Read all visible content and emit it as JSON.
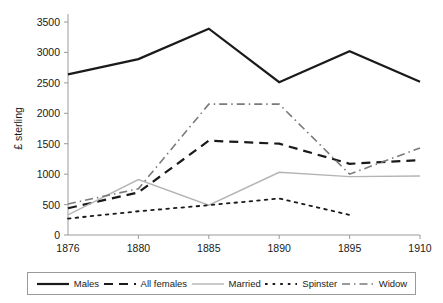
{
  "chart_data": {
    "type": "line",
    "title": "",
    "xlabel": "years",
    "ylabel": "£ sterling",
    "categories": [
      "1876",
      "1880",
      "1885",
      "1890",
      "1895",
      "1910"
    ],
    "x_ticks": [
      "1876",
      "1880",
      "1885",
      "1890",
      "1895",
      "1910"
    ],
    "y_ticks": [
      "0",
      "500",
      "1000",
      "1500",
      "2000",
      "2500",
      "3000",
      "3500"
    ],
    "ylim": [
      0,
      3500
    ],
    "grid": false,
    "legend_position": "bottom",
    "series": [
      {
        "name": "Males",
        "style": "solid",
        "color": "#1a1a1a",
        "width": 2.2,
        "values": [
          2640,
          2890,
          3390,
          2510,
          3020,
          2520
        ]
      },
      {
        "name": "All females",
        "style": "dashed",
        "color": "#1a1a1a",
        "width": 2.2,
        "values": [
          440,
          700,
          1550,
          1500,
          1170,
          1230
        ]
      },
      {
        "name": "Married",
        "style": "solid",
        "color": "#b4b4b4",
        "width": 1.4,
        "values": [
          330,
          910,
          490,
          1030,
          960,
          970
        ]
      },
      {
        "name": "Spinster",
        "style": "dotted",
        "color": "#1a1a1a",
        "width": 1.8,
        "values": [
          270,
          390,
          490,
          600,
          330,
          null
        ]
      },
      {
        "name": "Widow",
        "style": "dashdot",
        "color": "#7a7a7a",
        "width": 1.6,
        "values": [
          510,
          760,
          2150,
          2150,
          1000,
          1430
        ]
      }
    ]
  },
  "axis": {
    "y_title": "£ sterling",
    "x_title": "years"
  },
  "legend": {
    "items": [
      {
        "label": "Males",
        "swatch": "line-solid-black"
      },
      {
        "label": "All females",
        "swatch": "line-dashed-black"
      },
      {
        "label": "Married",
        "swatch": "line-solid-gray"
      },
      {
        "label": "Spinster",
        "swatch": "line-dotted-black"
      },
      {
        "label": "Widow",
        "swatch": "line-dashdot-gray"
      }
    ]
  },
  "colors": {
    "axis": "#9a9a9a",
    "primary": "#1a1a1a",
    "gray_series": "#b4b4b4",
    "widow_series": "#7a7a7a",
    "background": "#ffffff"
  }
}
